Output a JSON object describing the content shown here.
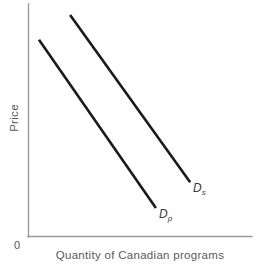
{
  "chart_data": {
    "type": "line",
    "title": "",
    "subtitle": "",
    "xlabel": "Quantity of Canadian programs",
    "ylabel": "Price",
    "origin_tick": "0",
    "grid": false,
    "legend_position": "inline-end-of-line",
    "axis_color": "#9a9a9a",
    "line_color": "#1a1a1a",
    "text_color": "#5a5a5a",
    "xlim": [
      0,
      100
    ],
    "ylim": [
      0,
      100
    ],
    "x_ticks": [],
    "y_ticks": [],
    "annotations": [
      {
        "name": "Ds",
        "letter": "D",
        "subscript": "s",
        "text": "Ds",
        "description": "Label for the subsidized / shifted demand curve, placed at the lower-right end of the upper line"
      },
      {
        "name": "Dp",
        "letter": "D",
        "subscript": "p",
        "text": "Dp",
        "description": "Label for the private demand curve, placed at the lower-right end of the lower line"
      }
    ],
    "series": [
      {
        "name": "Ds",
        "label_letter": "D",
        "label_subscript": "s",
        "x": [
          18.8,
          72.4
        ],
        "y": [
          95.3,
          23.2
        ],
        "style": "solid",
        "color": "#1a1a1a"
      },
      {
        "name": "Dp",
        "label_letter": "D",
        "label_subscript": "p",
        "x": [
          4.9,
          57.1
        ],
        "y": [
          84.6,
          12.1
        ],
        "style": "solid",
        "color": "#1a1a1a"
      }
    ]
  },
  "figure": {
    "background": "#ffffff",
    "axes": {
      "y_axis": "vertical line on the left",
      "x_axis": "horizontal baseline at the bottom"
    }
  }
}
